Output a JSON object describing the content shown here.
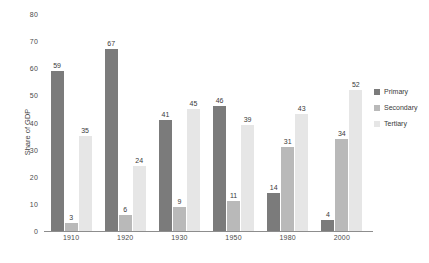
{
  "chart_data": {
    "type": "bar",
    "title": "",
    "subtitle": "",
    "xlabel": "",
    "ylabel": "Share of GDP",
    "ylim": [
      0,
      80
    ],
    "ytick_step": 10,
    "yticks": [
      "80",
      "70",
      "60",
      "50",
      "40",
      "30",
      "20",
      "10",
      "0"
    ],
    "grid": false,
    "legend_position": "right",
    "categories": [
      "1910",
      "1920",
      "1930",
      "1950",
      "1980",
      "2000"
    ],
    "series": [
      {
        "name": "Primary",
        "color": "#7b7b7b",
        "values": [
          59,
          67,
          41,
          46,
          14,
          4
        ]
      },
      {
        "name": "Secondary",
        "color": "#b9b9b9",
        "values": [
          3,
          6,
          9,
          11,
          31,
          34
        ]
      },
      {
        "name": "Tertiary",
        "color": "#e6e6e6",
        "values": [
          35,
          24,
          45,
          39,
          43,
          52
        ]
      }
    ]
  },
  "legend": {
    "items": [
      {
        "label": "Primary"
      },
      {
        "label": "Secondary"
      },
      {
        "label": "Tertiary"
      }
    ]
  },
  "footnote": ""
}
